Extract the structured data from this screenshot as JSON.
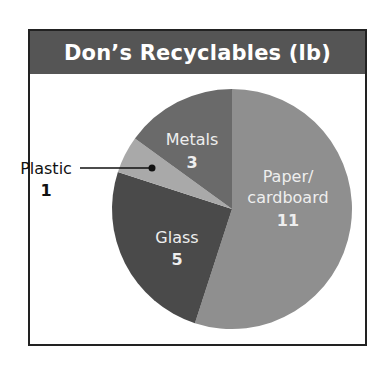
{
  "chart_data": {
    "type": "pie",
    "title": "Don’s Recyclables (lb)",
    "categories": [
      "Paper/cardboard",
      "Glass",
      "Plastic",
      "Metals"
    ],
    "values": [
      11,
      5,
      1,
      3
    ],
    "unit": "lb",
    "legend": "none (labels on slices; Plastic label via leader line)",
    "slices": [
      {
        "label": "Paper/",
        "label2": "cardboard",
        "value": "11",
        "color": "#8f8f8f"
      },
      {
        "label": "Glass",
        "value": "5",
        "color": "#4a4a4a"
      },
      {
        "label": "Plastic",
        "value": "1",
        "color": "#a9a9a9"
      },
      {
        "label": "Metals",
        "value": "3",
        "color": "#6a6a6a"
      }
    ]
  },
  "colors": {
    "title_bg": "#555555",
    "title_text": "#ffffff",
    "border": "#222222"
  }
}
